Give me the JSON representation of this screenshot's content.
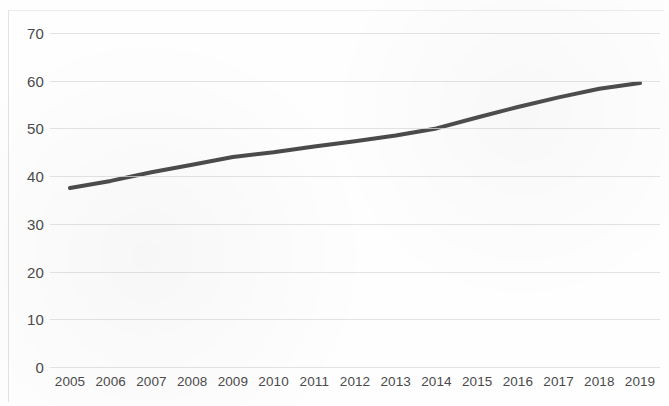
{
  "chart_data": {
    "type": "line",
    "title": "",
    "subtitle": "",
    "xlabel": "",
    "ylabel": "",
    "categories": [
      "2005",
      "2006",
      "2007",
      "2008",
      "2009",
      "2010",
      "2011",
      "2012",
      "2013",
      "2014",
      "2015",
      "2016",
      "2017",
      "2018",
      "2019"
    ],
    "series": [
      {
        "name": "Series 1",
        "color": "#4a4a4a",
        "values": [
          37.5,
          39.0,
          40.8,
          42.4,
          44.0,
          45.0,
          46.2,
          47.3,
          48.5,
          50.0,
          52.3,
          54.5,
          56.5,
          58.3,
          59.5
        ]
      }
    ],
    "ylim": [
      0,
      70
    ],
    "yticks": [
      0,
      10,
      20,
      30,
      40,
      50,
      60,
      70
    ],
    "ytick_labels": [
      "0",
      "10",
      "20",
      "30",
      "40",
      "50",
      "60",
      "70"
    ],
    "grid": "horizontal",
    "legend": "none",
    "line_width": 4,
    "markers": false,
    "colors": {
      "line": "#4a4a4a",
      "gridline": "#d9d9d9",
      "text": "#4a4a4a",
      "background": "#ffffff",
      "frame": "#e2e2e2"
    }
  }
}
